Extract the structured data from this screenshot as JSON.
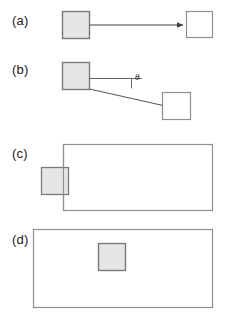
{
  "figure": {
    "width": 229,
    "height": 314,
    "background": "#ffffff",
    "type": "multi-panel-schematic-diagram"
  },
  "style": {
    "shaded_fill": "#e6e6e6",
    "unshaded_fill": "#ffffff",
    "stroke": "#808080",
    "dark_stroke": "#555555",
    "line_color": "#404040",
    "text_color": "#1a1a1a",
    "stroke_width": 1
  },
  "panels": [
    {
      "id": "a",
      "label": "(a)",
      "label_x": 12,
      "label_y": 13,
      "shapes": [
        {
          "name": "shaded-square-a",
          "kind": "square",
          "fill": "shaded",
          "x": 62,
          "y": 11,
          "width": 27,
          "height": 27
        },
        {
          "name": "unshaded-square-a",
          "kind": "square",
          "fill": "unshaded",
          "x": 186,
          "y": 11,
          "width": 26,
          "height": 26
        }
      ],
      "connector": {
        "name": "arrow-a",
        "kind": "arrow",
        "x1": 89,
        "y1": 24,
        "x2": 185,
        "y2": 24,
        "arrowhead": "solid-triangle"
      }
    },
    {
      "id": "b",
      "label": "(b)",
      "label_x": 12,
      "label_y": 62,
      "shapes": [
        {
          "name": "shaded-square-b",
          "kind": "square",
          "fill": "shaded",
          "x": 62,
          "y": 62,
          "width": 27,
          "height": 27
        },
        {
          "name": "unshaded-square-b",
          "kind": "square",
          "fill": "unshaded",
          "x": 162,
          "y": 92,
          "width": 28,
          "height": 27
        }
      ],
      "connector": {
        "name": "slanted-line-b",
        "kind": "line",
        "x1": 89,
        "y1": 89,
        "x2": 163,
        "y2": 105
      },
      "reference_line": {
        "name": "horizontal-reference-line-b",
        "x1": 89,
        "y1": 78,
        "x2": 142,
        "y2": 78
      },
      "angle_tick": {
        "name": "angle-tick-b",
        "x": 131,
        "y1": 78,
        "y2": 88
      },
      "angle_annotation": {
        "name": "theta-label",
        "symbol": "θ",
        "x": 135,
        "y": 74
      }
    },
    {
      "id": "c",
      "label": "(c)",
      "label_x": 12,
      "label_y": 146,
      "shapes": [
        {
          "name": "large-rectangle-c",
          "kind": "rectangle",
          "fill": "unshaded",
          "x": 63,
          "y": 144,
          "width": 149,
          "height": 66
        },
        {
          "name": "shaded-square-c",
          "kind": "square",
          "fill": "shaded",
          "x": 41,
          "y": 167,
          "width": 27,
          "height": 27
        }
      ]
    },
    {
      "id": "d",
      "label": "(d)",
      "label_x": 12,
      "label_y": 232,
      "shapes": [
        {
          "name": "large-rectangle-d",
          "kind": "rectangle",
          "fill": "unshaded",
          "x": 33,
          "y": 229,
          "width": 179,
          "height": 78
        },
        {
          "name": "shaded-square-d",
          "kind": "square",
          "fill": "shaded",
          "x": 98,
          "y": 243,
          "width": 27,
          "height": 27
        }
      ]
    }
  ]
}
